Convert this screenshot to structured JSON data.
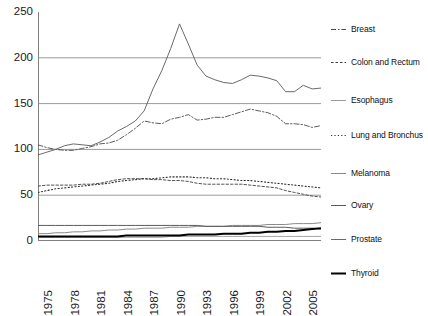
{
  "chart_data": {
    "type": "line",
    "title": "",
    "xlabel": "",
    "ylabel": "",
    "xlim": [
      1975,
      2007
    ],
    "ylim": [
      0,
      250
    ],
    "yticks": [
      "0",
      "50",
      "100",
      "150",
      "200",
      "250"
    ],
    "ytick_values": [
      0,
      50,
      100,
      150,
      200,
      250
    ],
    "grid": "horizontal gridlines at 50, 100, 150, 200",
    "legend_position": "right",
    "x": [
      1975,
      1976,
      1977,
      1978,
      1979,
      1980,
      1981,
      1982,
      1983,
      1984,
      1985,
      1986,
      1987,
      1988,
      1989,
      1990,
      1991,
      1992,
      1993,
      1994,
      1995,
      1996,
      1997,
      1998,
      1999,
      2000,
      2001,
      2002,
      2003,
      2004,
      2005,
      2006,
      2007
    ],
    "xticks": [
      "1975",
      "1978",
      "1981",
      "1984",
      "1987",
      "1990",
      "1993",
      "1996",
      "1999",
      "2002",
      "2005"
    ],
    "xtick_values": [
      1975,
      1978,
      1981,
      1984,
      1987,
      1990,
      1993,
      1996,
      1999,
      2002,
      2005
    ],
    "series": [
      {
        "name": "Breast",
        "style": "dash-dot",
        "values": [
          105,
          102,
          100,
          99,
          99,
          101,
          103,
          106,
          107,
          110,
          116,
          123,
          131,
          129,
          128,
          133,
          135,
          138,
          132,
          133,
          135,
          135,
          138,
          141,
          144,
          142,
          140,
          136,
          128,
          128,
          127,
          124,
          126
        ]
      },
      {
        "name": "Colon and Rectum",
        "style": "dashed-fine",
        "values": [
          60,
          61,
          61,
          61,
          61,
          62,
          62,
          63,
          65,
          67,
          68,
          68,
          68,
          67,
          67,
          66,
          66,
          65,
          63,
          62,
          62,
          62,
          62,
          62,
          61,
          60,
          59,
          58,
          55,
          53,
          51,
          49,
          48
        ]
      },
      {
        "name": "Esophagus",
        "style": "solid-thin",
        "values": [
          4,
          4,
          4,
          4,
          4,
          4,
          4,
          4,
          4,
          4,
          4,
          4,
          4,
          4,
          4,
          5,
          5,
          5,
          5,
          5,
          5,
          5,
          5,
          5,
          5,
          5,
          5,
          5,
          5,
          5,
          5,
          5,
          5
        ]
      },
      {
        "name": "Lung and Bronchus",
        "style": "dotted",
        "values": [
          53,
          55,
          57,
          58,
          59,
          60,
          61,
          62,
          63,
          65,
          66,
          67,
          68,
          68,
          69,
          70,
          70,
          70,
          69,
          69,
          68,
          68,
          67,
          66,
          66,
          65,
          64,
          63,
          62,
          61,
          60,
          59,
          58
        ]
      },
      {
        "name": "Melanoma",
        "style": "solid-gray",
        "values": [
          8,
          8,
          9,
          9,
          10,
          10,
          11,
          11,
          12,
          12,
          13,
          13,
          14,
          14,
          14,
          15,
          15,
          15,
          16,
          16,
          16,
          16,
          17,
          17,
          17,
          17,
          18,
          18,
          18,
          19,
          19,
          19,
          20
        ]
      },
      {
        "name": "Ovary",
        "style": "solid-medium",
        "values": [
          17,
          17,
          17,
          17,
          17,
          17,
          17,
          17,
          17,
          17,
          17,
          17,
          17,
          17,
          17,
          17,
          17,
          17,
          17,
          16,
          16,
          16,
          16,
          16,
          16,
          16,
          15,
          15,
          15,
          14,
          14,
          14,
          13
        ]
      },
      {
        "name": "Prostate",
        "style": "solid-curve",
        "values": [
          94,
          97,
          100,
          104,
          106,
          105,
          104,
          108,
          113,
          120,
          125,
          131,
          142,
          166,
          186,
          210,
          237,
          215,
          192,
          180,
          176,
          173,
          172,
          176,
          181,
          180,
          178,
          175,
          163,
          163,
          170,
          166,
          167
        ]
      },
      {
        "name": "Thyroid",
        "style": "solid-bold",
        "values": [
          5,
          5,
          5,
          5,
          5,
          5,
          5,
          5,
          5,
          5,
          6,
          6,
          6,
          6,
          6,
          6,
          6,
          7,
          7,
          7,
          7,
          8,
          8,
          8,
          9,
          9,
          10,
          10,
          11,
          11,
          12,
          13,
          14
        ]
      }
    ]
  },
  "legend": {
    "items": [
      {
        "label": "Breast",
        "style": "dash-dot"
      },
      {
        "label": "Colon and Rectum",
        "style": "dashed-fine"
      },
      {
        "label": "Esophagus",
        "style": "solid-thin"
      },
      {
        "label": "Lung and Bronchus",
        "style": "dotted"
      },
      {
        "label": "Melanoma",
        "style": "solid-gray"
      },
      {
        "label": "Ovary",
        "style": "solid-medium"
      },
      {
        "label": "Prostate",
        "style": "solid-curve"
      },
      {
        "label": "Thyroid",
        "style": "solid-bold"
      }
    ]
  },
  "colors": {
    "axis": "#808080",
    "grid": "#9b9b9b",
    "text": "#101010",
    "background": "#ffffff",
    "series_default": "#555555",
    "series_bold": "#000000"
  }
}
